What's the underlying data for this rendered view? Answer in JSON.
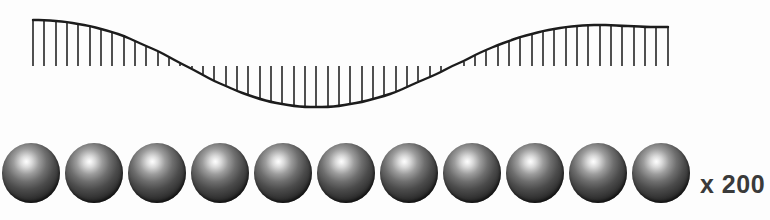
{
  "figure": {
    "background_color": "#fdfdfd",
    "ink_color": "#1c1c1c",
    "caption_multiplier": "x 200"
  },
  "wave": {
    "name": "sine-wave-with-hatch-ticks",
    "stroke_color": "#1c1c1c",
    "stroke_width": 2.4,
    "tick_color": "#242424",
    "tick_width": 1.6,
    "tick_count": 57,
    "tick_spacing_px": 11.2,
    "x_start": 33,
    "x_end": 668,
    "baseline_y": 66,
    "peak_left_y": 20,
    "trough_y": 107,
    "trough_x": 345,
    "peak_right_y": 27,
    "cycles": 1
  },
  "spheres": {
    "name": "sphere-row",
    "count": 11,
    "diameter_px": 58,
    "center_y": 173,
    "highlight_color": "#fdfdfd",
    "shadow_color": "#141414",
    "positions_x": [
      2,
      65,
      128,
      191,
      254,
      317,
      380,
      443,
      506,
      569,
      632
    ]
  },
  "chart_data": {
    "type": "line",
    "title": "",
    "xlabel": "",
    "ylabel": "",
    "grid": false,
    "legend": false,
    "series": [
      {
        "name": "sine wave envelope",
        "x": [
          33,
          44,
          56,
          67,
          78,
          90,
          101,
          112,
          124,
          135,
          146,
          158,
          169,
          180,
          192,
          203,
          214,
          226,
          237,
          248,
          260,
          271,
          282,
          294,
          305,
          316,
          328,
          339,
          350,
          362,
          373,
          384,
          396,
          407,
          418,
          430,
          441,
          452,
          464,
          475,
          486,
          498,
          509,
          520,
          532,
          543,
          554,
          566,
          577,
          588,
          600,
          611,
          622,
          634,
          645,
          656,
          668
        ],
        "y": [
          20,
          20,
          21,
          22,
          24,
          26,
          29,
          32,
          36,
          41,
          46,
          51,
          57,
          63,
          69,
          75,
          81,
          86,
          91,
          95,
          99,
          102,
          104,
          106,
          107,
          107,
          107,
          106,
          104,
          102,
          99,
          96,
          92,
          87,
          82,
          77,
          72,
          66,
          61,
          55,
          50,
          45,
          41,
          37,
          34,
          31,
          29,
          27,
          26,
          25,
          25,
          25,
          26,
          26,
          27,
          27,
          27
        ]
      }
    ],
    "baseline": 66,
    "ylim": [
      20,
      107
    ],
    "xlim": [
      33,
      668
    ]
  }
}
